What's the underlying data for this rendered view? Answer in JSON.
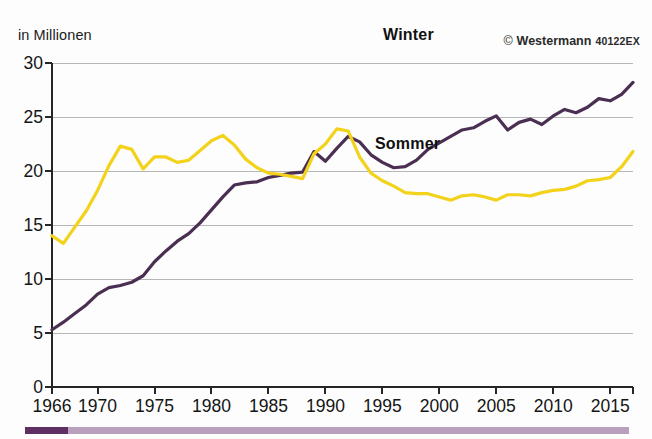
{
  "header": {
    "unit_label": "in Millionen",
    "credit_mark": "©",
    "credit_name": "Westermann",
    "credit_code": "40122EX"
  },
  "footer": {
    "progress_percent": 7
  },
  "chart_data": {
    "type": "line",
    "title": "",
    "subtitle": "",
    "xlabel": "",
    "ylabel": "in Millionen",
    "ylim": [
      0,
      30
    ],
    "xlim": [
      1966,
      2017
    ],
    "yticks": [
      0,
      5,
      10,
      15,
      20,
      25,
      30
    ],
    "xticks": [
      1966,
      1970,
      1975,
      1980,
      1985,
      1990,
      1995,
      2000,
      2005,
      2010,
      2015
    ],
    "grid": "horizontal",
    "legend": "inline-annotations",
    "colors": {
      "winter": "#4a2f52",
      "sommer": "#f2d21a",
      "grid": "#b6b6b6",
      "axis": "#262626",
      "footer_track": "#b9a0bc",
      "footer_fill": "#5d2f63"
    },
    "x": [
      1966,
      1967,
      1968,
      1969,
      1970,
      1971,
      1972,
      1973,
      1974,
      1975,
      1976,
      1977,
      1978,
      1979,
      1980,
      1981,
      1982,
      1983,
      1984,
      1985,
      1986,
      1987,
      1988,
      1989,
      1990,
      1991,
      1992,
      1993,
      1994,
      1995,
      1996,
      1997,
      1998,
      1999,
      2000,
      2001,
      2002,
      2003,
      2004,
      2005,
      2006,
      2007,
      2008,
      2009,
      2010,
      2011,
      2012,
      2013,
      2014,
      2015,
      2016,
      2017
    ],
    "series": [
      {
        "name": "Winter",
        "color": "#4a2f52",
        "values": [
          5.3,
          6.0,
          6.8,
          7.6,
          8.6,
          9.2,
          9.4,
          9.7,
          10.3,
          11.6,
          12.6,
          13.5,
          14.2,
          15.2,
          16.4,
          17.6,
          18.7,
          18.9,
          19.0,
          19.4,
          19.6,
          19.8,
          19.9,
          21.8,
          20.9,
          22.1,
          23.2,
          22.7,
          21.5,
          20.8,
          20.3,
          20.4,
          21.0,
          22.0,
          22.6,
          23.2,
          23.8,
          24.0,
          24.6,
          25.1,
          23.8,
          24.5,
          24.8,
          24.3,
          25.1,
          25.7,
          25.4,
          25.9,
          26.7,
          26.5,
          27.1,
          28.2
        ]
      },
      {
        "name": "Sommer",
        "color": "#f2d21a",
        "values": [
          14.0,
          13.3,
          14.8,
          16.3,
          18.2,
          20.5,
          22.3,
          22.0,
          20.2,
          21.3,
          21.3,
          20.8,
          21.0,
          21.9,
          22.8,
          23.3,
          22.4,
          21.1,
          20.3,
          19.8,
          19.7,
          19.5,
          19.3,
          21.6,
          22.5,
          23.9,
          23.7,
          21.3,
          19.8,
          19.1,
          18.6,
          18.0,
          17.9,
          17.9,
          17.6,
          17.3,
          17.7,
          17.8,
          17.6,
          17.3,
          17.8,
          17.8,
          17.7,
          18.0,
          18.2,
          18.3,
          18.6,
          19.1,
          19.2,
          19.4,
          20.4,
          21.8
        ]
      }
    ],
    "annotations": [
      {
        "text": "Winter",
        "series": "Winter",
        "x": 2001,
        "y": 26.6
      },
      {
        "text": "Sommer",
        "series": "Sommer",
        "x": 2000,
        "y": 16.0
      }
    ]
  }
}
